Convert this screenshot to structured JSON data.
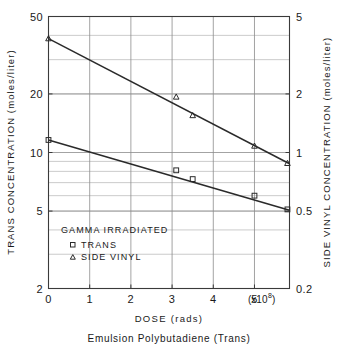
{
  "chart_data": {
    "type": "line",
    "title": "",
    "caption": "Emulsion Polybutadiene (Trans)",
    "xlabel": "DOSE (rads)",
    "x_multiplier": "(x10",
    "x_multiplier_exp": "8",
    "x_multiplier_close": ")",
    "ylabel_left": "TRANS CONCENTRATION (moles/liter)",
    "ylabel_right": "SIDE VINYL CONCENTRATION (moles/liter)",
    "xlim": [
      0,
      5.85
    ],
    "xticks": [
      0,
      1,
      2,
      3,
      4,
      5
    ],
    "xticklabels": [
      "0",
      "1",
      "2",
      "3",
      "4",
      "5"
    ],
    "yscale": "log",
    "ylim_left": [
      2,
      50
    ],
    "yticks_left": [
      2,
      5,
      10,
      20,
      50
    ],
    "yticklabels_left": [
      "2",
      "5",
      "10",
      "20",
      "50"
    ],
    "ylim_right": [
      0.2,
      5
    ],
    "yticks_right": [
      0.2,
      0.5,
      1,
      2,
      5
    ],
    "yticklabels_right": [
      "0.2",
      "0.5",
      "1",
      "2",
      "5"
    ],
    "grid": true,
    "legend_position": "lower-left-inside",
    "legend_title": "GAMMA IRRADIATED",
    "series": [
      {
        "name": "TRANS",
        "marker": "square",
        "axis": "left",
        "points": [
          {
            "x": 0.0,
            "y": 11.6
          },
          {
            "x": 3.1,
            "y": 8.1
          },
          {
            "x": 3.5,
            "y": 7.3
          },
          {
            "x": 5.0,
            "y": 6.0
          },
          {
            "x": 5.8,
            "y": 5.1
          }
        ],
        "fit_line": [
          {
            "x": 0.0,
            "y": 11.6
          },
          {
            "x": 5.85,
            "y": 5.05
          }
        ]
      },
      {
        "name": "SIDE VINYL",
        "marker": "triangle",
        "axis": "right",
        "points": [
          {
            "x": 0.0,
            "y": 3.85
          },
          {
            "x": 3.1,
            "y": 1.93
          },
          {
            "x": 3.5,
            "y": 1.55
          },
          {
            "x": 5.0,
            "y": 1.08
          },
          {
            "x": 5.8,
            "y": 0.88
          }
        ],
        "fit_line": [
          {
            "x": 0.0,
            "y": 3.85
          },
          {
            "x": 5.85,
            "y": 0.875
          }
        ]
      }
    ],
    "colors": {
      "line": "#2a2a2a",
      "grid": "#8c8c8c",
      "frame": "#3a3a3a",
      "text": "#1a1a1a",
      "background": "#ffffff"
    }
  },
  "legend": {
    "title": "GAMMA IRRADIATED",
    "entries": [
      {
        "marker": "square",
        "label": "TRANS"
      },
      {
        "marker": "triangle",
        "label": "SIDE VINYL"
      }
    ]
  }
}
